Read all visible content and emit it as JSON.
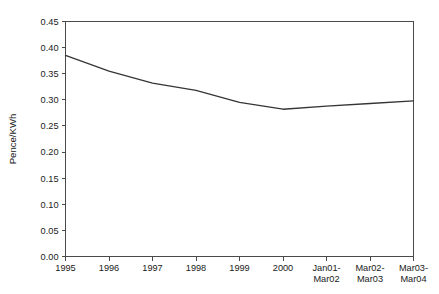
{
  "chart_data": {
    "type": "line",
    "title": "",
    "xlabel": "",
    "ylabel": "Pence/KWh",
    "categories": [
      "1995",
      "1996",
      "1997",
      "1998",
      "1999",
      "2000",
      "Jan01-\nMar02",
      "Mar02-\nMar03",
      "Mar03-\nMar04"
    ],
    "category_lines": [
      [
        "1995"
      ],
      [
        "1996"
      ],
      [
        "1997"
      ],
      [
        "1998"
      ],
      [
        "1999"
      ],
      [
        "2000"
      ],
      [
        "Jan01-",
        "Mar02"
      ],
      [
        "Mar02-",
        "Mar03"
      ],
      [
        "Mar03-",
        "Mar04"
      ]
    ],
    "values": [
      0.385,
      0.355,
      0.332,
      0.318,
      0.295,
      0.282,
      0.288,
      0.293,
      0.298
    ],
    "series": [
      {
        "name": "Pence/KWh",
        "values": [
          0.385,
          0.355,
          0.332,
          0.318,
          0.295,
          0.282,
          0.288,
          0.293,
          0.298
        ]
      }
    ],
    "ylim": [
      0.0,
      0.45
    ],
    "ytick_values": [
      0.0,
      0.05,
      0.1,
      0.15,
      0.2,
      0.25,
      0.3,
      0.35,
      0.4,
      0.45
    ],
    "ytick_labels": [
      "0.00",
      "0.05",
      "0.10",
      "0.15",
      "0.20",
      "0.25",
      "0.30",
      "0.35",
      "0.40",
      "0.45"
    ],
    "grid": false,
    "legend": false,
    "legend_position": "none",
    "line_color": "#353535",
    "axis_color": "#4a4a4a",
    "background_color": "#ffffff"
  }
}
